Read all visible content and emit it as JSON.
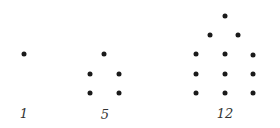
{
  "colors": {
    "dot": "#1a1a1a",
    "label": "#333333",
    "background": "#ffffff"
  },
  "figures": [
    {
      "label": "1",
      "label_pos": [
        24,
        113
      ],
      "dots": [
        [
          24,
          54
        ]
      ]
    },
    {
      "label": "5",
      "label_pos": [
        105,
        114
      ],
      "dots": [
        [
          104,
          54
        ],
        [
          90,
          74
        ],
        [
          119,
          74
        ],
        [
          90,
          93
        ],
        [
          119,
          93
        ]
      ]
    },
    {
      "label": "12",
      "label_pos": [
        225,
        113
      ],
      "dots": [
        [
          225,
          16
        ],
        [
          210,
          35
        ],
        [
          238,
          35
        ],
        [
          196,
          54
        ],
        [
          225,
          54
        ],
        [
          253,
          55
        ],
        [
          196,
          74
        ],
        [
          225,
          74
        ],
        [
          253,
          74
        ],
        [
          196,
          93
        ],
        [
          225,
          93
        ],
        [
          253,
          93
        ]
      ]
    }
  ]
}
